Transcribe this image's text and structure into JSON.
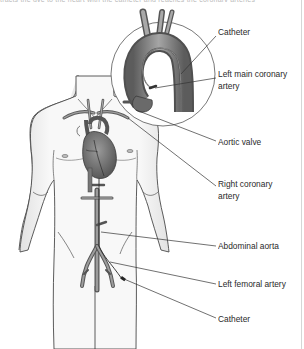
{
  "figure": {
    "header_fragment": "tracts the dye to the heart with the catheter and reaches the coronary arteries",
    "labels": [
      {
        "id": "catheter-top",
        "text": "Catheter",
        "x": 218,
        "y": 30
      },
      {
        "id": "left-main-coronary-artery",
        "text": "Left main coronary",
        "text2": "artery",
        "x": 218,
        "y": 72
      },
      {
        "id": "aortic-valve",
        "text": "Aortic valve",
        "x": 218,
        "y": 134
      },
      {
        "id": "right-coronary-artery",
        "text": "Right coronary",
        "text2": "artery",
        "x": 218,
        "y": 180
      },
      {
        "id": "abdominal-aorta",
        "text": "Abdominal aorta",
        "x": 218,
        "y": 240
      },
      {
        "id": "left-femoral-artery",
        "text": "Left femoral artery",
        "x": 218,
        "y": 278
      },
      {
        "id": "catheter-bottom",
        "text": "Catheter",
        "x": 218,
        "y": 312
      }
    ],
    "colors": {
      "line": "#333333",
      "body_fill": "#f4f4f4",
      "body_outline": "#444444",
      "vessel": "#8a8a8a",
      "vessel_dark": "#5a5a5a",
      "heart": "#6e6e6e",
      "label_text": "#2a2a2a"
    }
  }
}
